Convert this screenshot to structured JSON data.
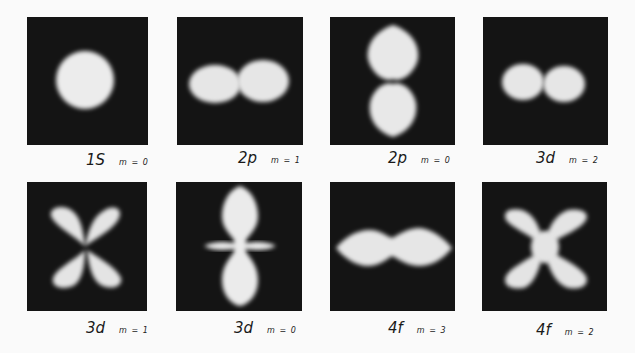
{
  "figure": {
    "background_color": "#fafafa",
    "panel_color": "#141414",
    "glow_color": "#e8e8e8",
    "panels": [
      {
        "orbital": "1S",
        "m_label": "m = 0",
        "shape": "sphere"
      },
      {
        "orbital": "2p",
        "m_label": "m = 1",
        "shape": "horizontal-two-lobes"
      },
      {
        "orbital": "2p",
        "m_label": "m = 0",
        "shape": "vertical-two-lobes"
      },
      {
        "orbital": "3d",
        "m_label": "m = 2",
        "shape": "horizontal-two-small-lobes"
      },
      {
        "orbital": "3d",
        "m_label": "m = 1",
        "shape": "four-lobes-butterfly"
      },
      {
        "orbital": "3d",
        "m_label": "m = 0",
        "shape": "two-lobes-with-ring"
      },
      {
        "orbital": "4f",
        "m_label": "m = 3",
        "shape": "horizontal-diamond-lobes"
      },
      {
        "orbital": "4f",
        "m_label": "m = 2",
        "shape": "x-four-lobes"
      }
    ]
  }
}
